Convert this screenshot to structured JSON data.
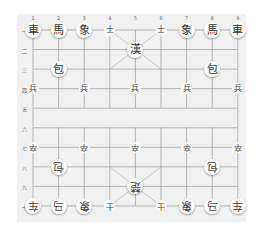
{
  "board": {
    "origin": {
      "x": 33,
      "y": 30
    },
    "col_spacing": 25.6,
    "row_spacing": 19.55,
    "line_color": "#9a9a9a",
    "background": "#f1f1f1"
  },
  "column_labels": [
    "1",
    "2",
    "3",
    "4",
    "5",
    "6",
    "7",
    "8",
    "9"
  ],
  "row_labels": [
    "一",
    "二",
    "三",
    "四",
    "五",
    "六",
    "七",
    "八",
    "九",
    "十"
  ],
  "pieces": [
    {
      "side": "black",
      "type": "chariot",
      "char": "車",
      "col": 0,
      "row": 0
    },
    {
      "side": "black",
      "type": "horse",
      "char": "馬",
      "col": 1,
      "row": 0
    },
    {
      "side": "black",
      "type": "elephant",
      "char": "象",
      "col": 2,
      "row": 0
    },
    {
      "side": "black",
      "type": "advisor",
      "char": "士",
      "col": 3,
      "row": 0,
      "small": true
    },
    {
      "side": "black",
      "type": "advisor",
      "char": "士",
      "col": 5,
      "row": 0,
      "small": true
    },
    {
      "side": "black",
      "type": "elephant",
      "char": "象",
      "col": 6,
      "row": 0
    },
    {
      "side": "black",
      "type": "horse",
      "char": "馬",
      "col": 7,
      "row": 0
    },
    {
      "side": "black",
      "type": "chariot",
      "char": "車",
      "col": 8,
      "row": 0
    },
    {
      "side": "black",
      "type": "general",
      "char": "漢",
      "col": 4,
      "row": 1
    },
    {
      "side": "black",
      "type": "cannon",
      "char": "包",
      "col": 1,
      "row": 2
    },
    {
      "side": "black",
      "type": "cannon",
      "char": "包",
      "col": 7,
      "row": 2
    },
    {
      "side": "black",
      "type": "soldier",
      "char": "兵",
      "col": 0,
      "row": 3,
      "small": true
    },
    {
      "side": "black",
      "type": "soldier",
      "char": "兵",
      "col": 2,
      "row": 3,
      "small": true
    },
    {
      "side": "black",
      "type": "soldier",
      "char": "兵",
      "col": 4,
      "row": 3,
      "small": true
    },
    {
      "side": "black",
      "type": "soldier",
      "char": "兵",
      "col": 6,
      "row": 3,
      "small": true
    },
    {
      "side": "black",
      "type": "soldier",
      "char": "兵",
      "col": 8,
      "row": 3,
      "small": true
    },
    {
      "side": "red",
      "type": "soldier",
      "char": "卒",
      "col": 0,
      "row": 6,
      "small": true
    },
    {
      "side": "red",
      "type": "soldier",
      "char": "卒",
      "col": 2,
      "row": 6,
      "small": true
    },
    {
      "side": "red",
      "type": "soldier",
      "char": "卒",
      "col": 4,
      "row": 6,
      "small": true
    },
    {
      "side": "red",
      "type": "soldier",
      "char": "卒",
      "col": 6,
      "row": 6,
      "small": true
    },
    {
      "side": "red",
      "type": "soldier",
      "char": "卒",
      "col": 8,
      "row": 6,
      "small": true
    },
    {
      "side": "red",
      "type": "cannon",
      "char": "包",
      "col": 1,
      "row": 7
    },
    {
      "side": "red",
      "type": "cannon",
      "char": "包",
      "col": 7,
      "row": 7
    },
    {
      "side": "red",
      "type": "general",
      "char": "楚",
      "col": 4,
      "row": 8
    },
    {
      "side": "red",
      "type": "chariot",
      "char": "车",
      "col": 0,
      "row": 9
    },
    {
      "side": "red",
      "type": "horse",
      "char": "马",
      "col": 1,
      "row": 9
    },
    {
      "side": "red",
      "type": "elephant",
      "char": "象",
      "col": 2,
      "row": 9
    },
    {
      "side": "red",
      "type": "advisor",
      "char": "士",
      "col": 3,
      "row": 9,
      "small": true
    },
    {
      "side": "red",
      "type": "advisor",
      "char": "士",
      "col": 5,
      "row": 9,
      "small": true
    },
    {
      "side": "red",
      "type": "elephant",
      "char": "象",
      "col": 6,
      "row": 9
    },
    {
      "side": "red",
      "type": "horse",
      "char": "马",
      "col": 7,
      "row": 9
    },
    {
      "side": "red",
      "type": "chariot",
      "char": "车",
      "col": 8,
      "row": 9
    }
  ]
}
